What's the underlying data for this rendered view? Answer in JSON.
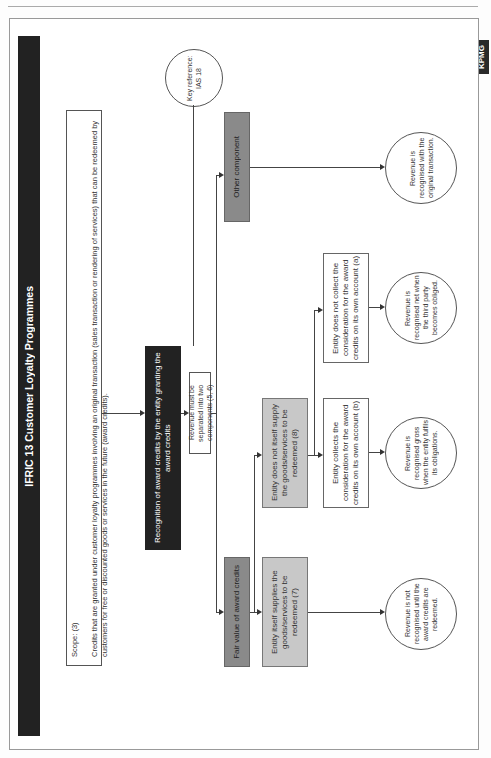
{
  "page": {
    "header_fragment": "Customer Loyalty Programmes",
    "side_logo": "KPMG"
  },
  "diagram": {
    "title": "IFRIC 13 Customer Loyalty Programmes",
    "key_reference": "Key reference: IAS 18",
    "scope": {
      "label": "Scope: (3)",
      "text": "Credits that are granted under customer loyalty programmes involving an original transaction (sales transaction or rendering of services) that can be redeemed by customers for free or discounted goods or services in the future (award credits)."
    },
    "recognition": "Recognition of award credits by the entity granting the award credits",
    "separation": "Revenue must be separated into two components (5, 6)",
    "components": {
      "fair_value": "Fair value of award credits",
      "other": "Other component"
    },
    "supply": {
      "itself": "Entity itself supplies the goods/services to be redeemed (7)",
      "not_itself": "Entity does not itself supply the goods/services to be redeemed (8)"
    },
    "collection": {
      "collects": "Entity collects the consideration for the award credits on its own account (b)",
      "not_collect": "Entity does not collect the consideration for the award credits on its own account (a)"
    },
    "outcomes": {
      "original": "Revenue is recognised with the original transaction.",
      "net": "Revenue is recognised net when the third party becomes obliged.",
      "gross": "Revenue is recognised gross when the entity fulfils its obligations.",
      "not_recognised": "Revenue is not recognised until the award credits are redeemed."
    }
  },
  "colors": {
    "dark_box": "#222222",
    "mid_gray_box": "#8a8a8a",
    "light_gray_box": "#c8c8c8",
    "line": "#444444"
  }
}
